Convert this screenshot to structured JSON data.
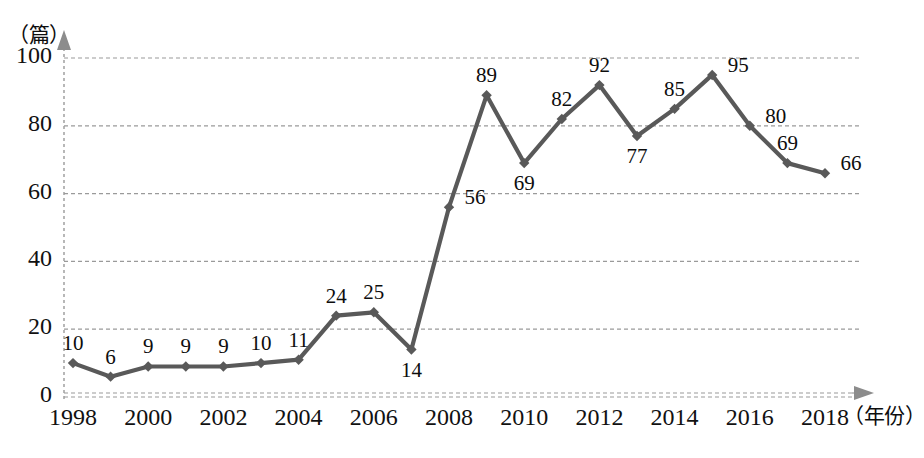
{
  "chart_data": {
    "type": "line",
    "title": "",
    "xlabel": "年份",
    "ylabel": "篇",
    "x_unit_label": "（年份）",
    "y_unit_label": "（篇）",
    "categories": [
      1998,
      1999,
      2000,
      2001,
      2002,
      2003,
      2004,
      2005,
      2006,
      2007,
      2008,
      2009,
      2010,
      2011,
      2012,
      2013,
      2014,
      2015,
      2016,
      2017,
      2018
    ],
    "values": [
      10,
      6,
      9,
      9,
      9,
      10,
      11,
      24,
      25,
      14,
      56,
      89,
      69,
      82,
      92,
      77,
      85,
      95,
      80,
      69,
      66
    ],
    "point_labels": [
      "10",
      "6",
      "9",
      "9",
      "9",
      "10",
      "11",
      "24",
      "25",
      "14",
      "56",
      "89",
      "69",
      "82",
      "92",
      "77",
      "85",
      "95",
      "80",
      "69",
      "66"
    ],
    "label_positions": [
      "above",
      "above",
      "above",
      "above",
      "above",
      "above",
      "above",
      "above",
      "above",
      "below",
      "right",
      "above",
      "below",
      "above",
      "above",
      "below",
      "above",
      "right",
      "right",
      "above",
      "right"
    ],
    "xlim": [
      1998,
      2018
    ],
    "ylim": [
      0,
      100
    ],
    "y_ticks": [
      0,
      20,
      40,
      60,
      80,
      100
    ],
    "y_tick_labels": [
      "0",
      "20",
      "40",
      "60",
      "80",
      "100"
    ],
    "x_ticks": [
      1998,
      2000,
      2002,
      2004,
      2006,
      2008,
      2010,
      2012,
      2014,
      2016,
      2018
    ],
    "x_tick_labels": [
      "1998",
      "2000",
      "2002",
      "2004",
      "2006",
      "2008",
      "2010",
      "2012",
      "2014",
      "2016",
      "2018"
    ],
    "grid": true,
    "grid_style": "dashed",
    "legend": "none",
    "series_color": "#595959",
    "grid_color": "#9a9a9a",
    "axis_color": "#8c8c8c",
    "marker": "diamond"
  }
}
